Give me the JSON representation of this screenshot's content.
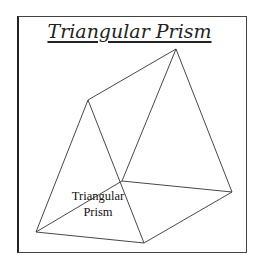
{
  "title": "Triangular Prism",
  "label": {
    "line1": "Triangular",
    "line2": "Prism"
  },
  "colors": {
    "line": "#333333",
    "background": "#ffffff"
  }
}
